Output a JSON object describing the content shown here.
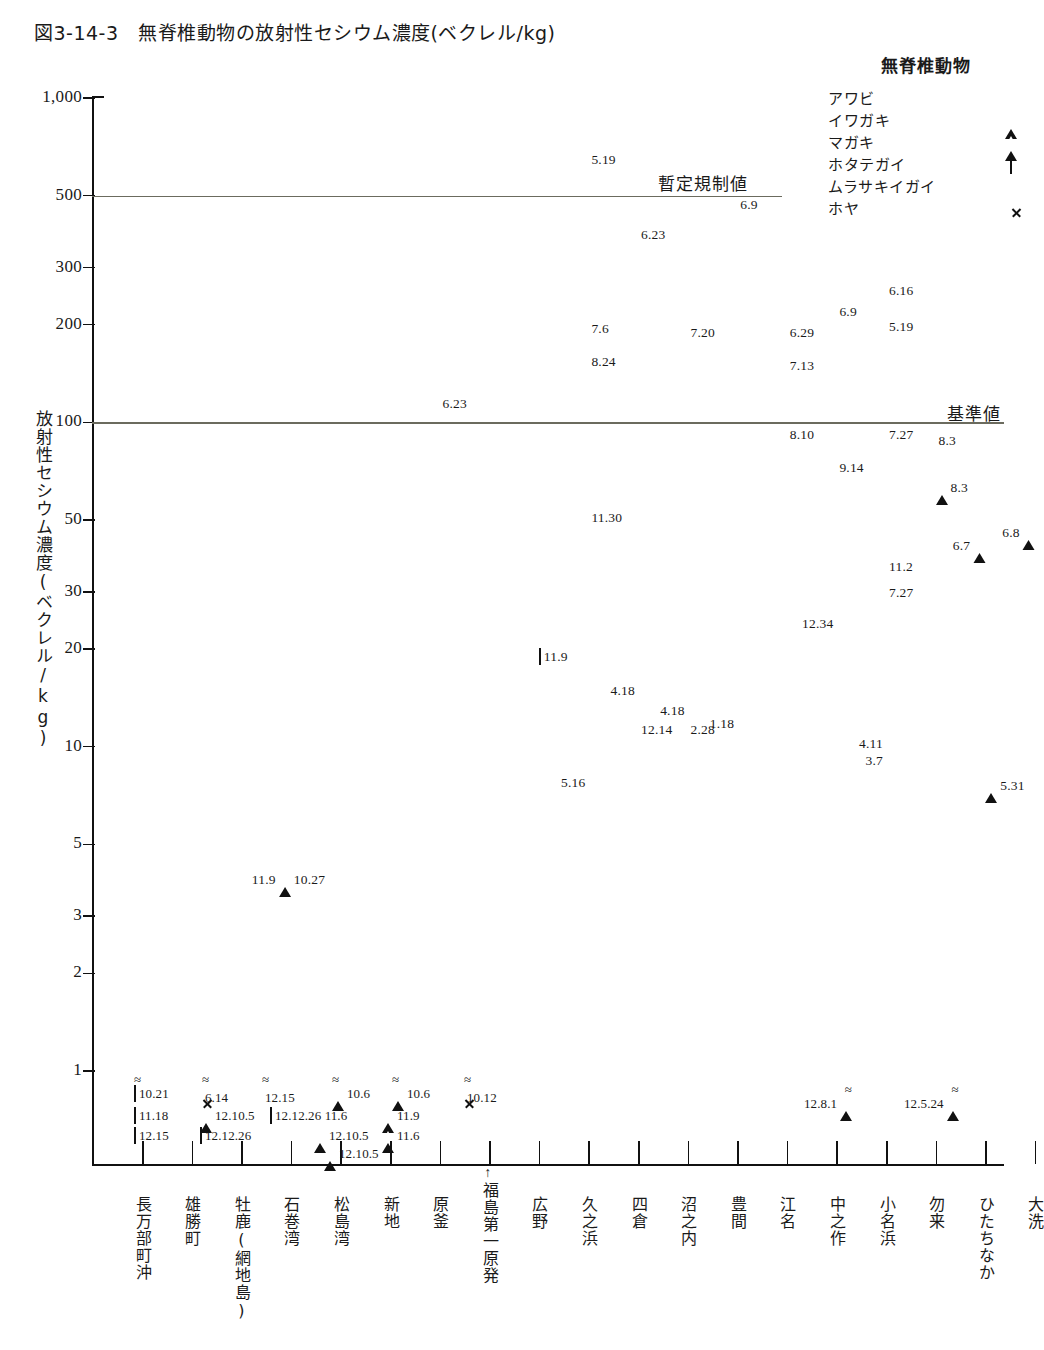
{
  "title": "図3-14-3　無脊椎動物の放射性セシウム濃度(ベクレル/kg)",
  "legend": {
    "title": "無脊椎動物",
    "items": [
      {
        "label": "アワビ",
        "marker": "circle-filled"
      },
      {
        "label": "イワガキ",
        "marker": "triangle-filled"
      },
      {
        "label": "マガキ",
        "marker": "triangle-open"
      },
      {
        "label": "ホタテガイ",
        "marker": "square-open"
      },
      {
        "label": "ムラサキイガイ",
        "marker": "diamond-filled"
      },
      {
        "label": "ホヤ",
        "marker": "x-mark"
      }
    ]
  },
  "chart_data": {
    "type": "scatter",
    "title": "図3-14-3　無脊椎動物の放射性セシウム濃度(ベクレル/kg)",
    "ylabel": "放射性セシウム濃度(ベクレル/kg)",
    "xlabel": "",
    "yscale": "log",
    "ylim": [
      0.6,
      1000
    ],
    "yticks": [
      "1,000",
      "500",
      "300",
      "200",
      "100",
      "50",
      "30",
      "20",
      "10",
      "5",
      "3",
      "2",
      "1"
    ],
    "ytick_values": [
      1000,
      500,
      300,
      200,
      100,
      50,
      30,
      20,
      10,
      5,
      3,
      2,
      1
    ],
    "grid": false,
    "legend_position": "top-right",
    "categories": [
      "長万部町沖",
      "雄勝町",
      "牡鹿(網地島)",
      "石巻湾",
      "松島湾",
      "新地",
      "原釜",
      "福島第一原発",
      "広野",
      "久之浜",
      "四倉",
      "沼之内",
      "豊間",
      "江名",
      "中之作",
      "小名浜",
      "勿来",
      "ひたちなか",
      "大洗"
    ],
    "reference_lines": [
      {
        "label": "暫定規制値",
        "value": 500
      },
      {
        "label": "基準値",
        "value": 100
      }
    ],
    "series": [
      {
        "name": "アワビ",
        "marker": "circle-filled"
      },
      {
        "name": "イワガキ",
        "marker": "triangle-filled"
      },
      {
        "name": "マガキ",
        "marker": "triangle-open"
      },
      {
        "name": "ホタテガイ",
        "marker": "square-open"
      },
      {
        "name": "ムラサキイガイ",
        "marker": "diamond-filled"
      },
      {
        "name": "ホヤ",
        "marker": "x-mark"
      }
    ],
    "points": [
      {
        "category": "原釜",
        "value": 115,
        "label": "6.23",
        "marker": "circle-filled",
        "series": "アワビ",
        "label_side": "right"
      },
      {
        "category": "久之浜",
        "value": 650,
        "label": "5.19",
        "marker": "diamond-filled",
        "series": "ムラサキイガイ",
        "label_side": "right"
      },
      {
        "category": "久之浜",
        "value": 195,
        "label": "7.6",
        "marker": "circle-filled",
        "series": "アワビ",
        "label_side": "right"
      },
      {
        "category": "久之浜",
        "value": 155,
        "label": "8.24",
        "marker": "circle-filled",
        "series": "アワビ",
        "label_side": "right"
      },
      {
        "category": "久之浜",
        "value": 51,
        "label": "11.30",
        "marker": "circle-filled",
        "series": "アワビ",
        "label_side": "right"
      },
      {
        "category": "久之浜",
        "value": 7.8,
        "label": "5.16",
        "marker": "circle-filled",
        "series": "アワビ",
        "label_side": "left"
      },
      {
        "category": "四倉",
        "value": 380,
        "label": "6.23",
        "marker": "circle-filled",
        "series": "アワビ",
        "label_side": "right"
      },
      {
        "category": "四倉",
        "value": 15,
        "label": "4.18",
        "marker": "circle-filled",
        "series": "アワビ",
        "label_side": "left"
      },
      {
        "category": "四倉",
        "value": 11.3,
        "label": "12.14",
        "marker": "circle-filled",
        "series": "アワビ",
        "label_side": "right"
      },
      {
        "category": "沼之内",
        "value": 190,
        "label": "7.20",
        "marker": "circle-filled",
        "series": "アワビ",
        "label_side": "right"
      },
      {
        "category": "沼之内",
        "value": 13,
        "label": "4.18",
        "marker": "circle-filled",
        "series": "アワビ",
        "label_side": "left"
      },
      {
        "category": "沼之内",
        "value": 11.3,
        "label": "2.28",
        "marker": "circle-filled",
        "series": "アワビ",
        "label_side": "right"
      },
      {
        "category": "豊間",
        "value": 470,
        "label": "6.9",
        "marker": "circle-filled",
        "series": "アワビ",
        "label_side": "right"
      },
      {
        "category": "豊間",
        "value": 11.8,
        "label": "1.18",
        "marker": "circle-filled",
        "series": "アワビ",
        "label_side": "left"
      },
      {
        "category": "江名",
        "value": 190,
        "label": "6.29",
        "marker": "circle-filled",
        "series": "アワビ",
        "label_side": "right"
      },
      {
        "category": "江名",
        "value": 150,
        "label": "7.13",
        "marker": "circle-filled",
        "series": "アワビ",
        "label_side": "right"
      },
      {
        "category": "江名",
        "value": 92,
        "label": "8.10",
        "marker": "circle-filled",
        "series": "アワビ",
        "label_side": "right"
      },
      {
        "category": "中之作",
        "value": 220,
        "label": "6.9",
        "marker": "diamond-filled",
        "series": "ムラサキイガイ",
        "label_side": "right"
      },
      {
        "category": "中之作",
        "value": 73,
        "label": "9.14",
        "marker": "circle-filled",
        "series": "アワビ",
        "label_side": "right"
      },
      {
        "category": "中之作",
        "value": 24,
        "label": "12.34",
        "marker": "diamond-filled",
        "series": "ムラサキイガイ",
        "label_side": "left"
      },
      {
        "category": "小名浜",
        "value": 255,
        "label": "6.16",
        "marker": "circle-filled",
        "series": "アワビ",
        "label_side": "right"
      },
      {
        "category": "小名浜",
        "value": 198,
        "label": "5.19",
        "marker": "diamond-filled",
        "series": "ムラサキイガイ",
        "label_side": "right"
      },
      {
        "category": "小名浜",
        "value": 92,
        "label": "7.27",
        "marker": "circle-filled",
        "series": "アワビ",
        "label_side": "right"
      },
      {
        "category": "小名浜",
        "value": 36,
        "label": "11.2",
        "marker": "circle-filled",
        "series": "アワビ",
        "label_side": "right"
      },
      {
        "category": "小名浜",
        "value": 30,
        "label": "7.27",
        "marker": "diamond-filled",
        "series": "ムラサキイガイ",
        "label_side": "right"
      },
      {
        "category": "小名浜",
        "value": 10.3,
        "label": "4.11",
        "marker": "circle-filled",
        "series": "アワビ",
        "label_side": "left"
      },
      {
        "category": "小名浜",
        "value": 9.1,
        "label": "3.7",
        "marker": "circle-filled",
        "series": "アワビ",
        "label_side": "left"
      },
      {
        "category": "勿来",
        "value": 88,
        "label": "8.3",
        "marker": "circle-filled",
        "series": "アワビ",
        "label_side": "right"
      },
      {
        "category": "勿来",
        "value": 63,
        "label": "8.3",
        "marker": "triangle-filled",
        "series": "イワガキ",
        "label_side": "right"
      },
      {
        "category": "ひたちなか",
        "value": 42,
        "label": "6.7",
        "marker": "triangle-filled",
        "series": "イワガキ",
        "label_side": "left"
      },
      {
        "category": "ひたちなか",
        "value": 7.6,
        "label": "5.31",
        "marker": "triangle-filled",
        "series": "イワガキ",
        "label_side": "right"
      },
      {
        "category": "大洗",
        "value": 46,
        "label": "6.8",
        "marker": "triangle-filled",
        "series": "イワガキ",
        "label_side": "left"
      },
      {
        "category": "広野",
        "value": 19,
        "label": "11.9",
        "marker": "square-open",
        "series": "ホタテガイ",
        "label_side": "right"
      },
      {
        "category": "石巻湾",
        "value": 3.9,
        "label": "11.9",
        "marker": "triangle-open",
        "series": "マガキ",
        "label_side": "left"
      },
      {
        "category": "石巻湾",
        "value": 3.9,
        "label": "10.27",
        "marker": "circle-filled",
        "series": "アワビ",
        "label_side": "right"
      }
    ],
    "below_detection_annotations": {
      "note": "Values below detection limit, shown beneath the axis break (≈) marks",
      "rows": [
        [
          {
            "marker": "square-open",
            "label": "10.21",
            "wavy": true
          },
          {
            "marker": "x-mark",
            "label": "6.14",
            "wavy": true
          },
          {
            "marker": "circle-filled",
            "label": "12.15",
            "wavy": true
          },
          {
            "marker": "triangle-open",
            "label": "10.6",
            "wavy": true
          },
          {
            "marker": "triangle-open",
            "label": "10.6",
            "wavy": true
          },
          {
            "marker": "x-mark",
            "label": "10.12",
            "wavy": true
          }
        ],
        [
          {
            "marker": "square-open",
            "label": "11.18",
            "wavy": false
          },
          {
            "marker": "triangle-open",
            "label": "12.10.5",
            "wavy": false
          },
          {
            "marker": "square-open",
            "label": "12.12.26 11.6",
            "wavy": false
          },
          {
            "marker": "triangle-open",
            "label": "11.9",
            "wavy": false
          }
        ],
        [
          {
            "marker": "square-open",
            "label": "12.15",
            "wavy": false
          },
          {
            "marker": "square-open",
            "label": "12.12.26",
            "wavy": false
          },
          {
            "marker": "triangle-open",
            "label": "12.10.5",
            "wavy": false
          },
          {
            "marker": "triangle-open",
            "label": "11.6",
            "wavy": false
          }
        ],
        [
          {
            "marker": "triangle-open",
            "label": "12.10.5",
            "wavy": false
          }
        ]
      ],
      "right_items": [
        {
          "marker": "triangle-filled",
          "label": "12.8.1",
          "wavy": true,
          "label_side": "left"
        },
        {
          "marker": "triangle-filled",
          "label": "12.5.24",
          "wavy": true,
          "label_side": "left"
        }
      ]
    }
  },
  "colors": {
    "ink": "#1a1a1a",
    "refline": "#6b6b5e",
    "marker": "#111111",
    "background": "#ffffff"
  }
}
